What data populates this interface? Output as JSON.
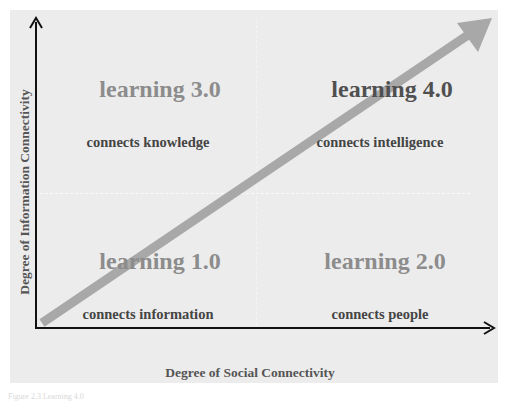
{
  "axes": {
    "y_label": "Degree of Information Connectivity",
    "x_label": "Degree of Social Connectivity"
  },
  "quadrants": [
    {
      "id": "top-left",
      "title": "learning 3.0",
      "subtitle": "connects knowledge",
      "title_color": "#8c8c8c"
    },
    {
      "id": "top-right",
      "title": "learning 4.0",
      "subtitle": "connects intelligence",
      "title_color": "#505050"
    },
    {
      "id": "bottom-left",
      "title": "learning 1.0",
      "subtitle": "connects information",
      "title_color": "#8c8c8c"
    },
    {
      "id": "bottom-right",
      "title": "learning 2.0",
      "subtitle": "connects people",
      "title_color": "#8c8c8c"
    }
  ],
  "arrow": {
    "color": "#a8a8a8",
    "direction": "bottom-left to top-right"
  },
  "caption": "Figure 2.3  Learning 4.0"
}
